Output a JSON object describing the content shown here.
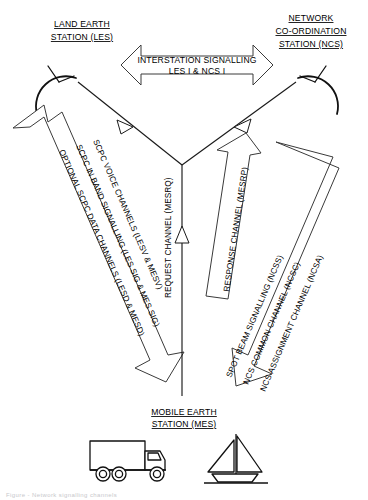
{
  "diagram": {
    "title_bottom_fragment": "Figure  - Network signalling channels",
    "nodes": {
      "les": {
        "line1": "LAND EARTH",
        "line2": "STATION (LES)",
        "icon": "satellite-dish-icon"
      },
      "ncs": {
        "line1": "NETWORK",
        "line2": "CO-ORDINATION",
        "line3": "STATION (NCS)",
        "icon": "satellite-dish-icon"
      },
      "mes": {
        "line1": "MOBILE EARTH",
        "line2": "STATION (MES)",
        "icon_truck": "truck-icon",
        "icon_boat": "sailboat-icon"
      }
    },
    "links": {
      "interstation": {
        "line1": "INTERSTATION SIGNALLING",
        "line2": "LES I & NCS I",
        "style": "double-headed-block-arrow",
        "direction": "bidirectional"
      },
      "les_mes": {
        "line1": "SCPC VOICE CHANNELS (LESV & MESV)",
        "line2": "SCPC IN BAND SIGNALLING (LES SIG & MES SIG)",
        "line3": "OPTIONAL SCPC DATA CHANNELS (LESD & MESD)",
        "style": "double-headed-block-arrow",
        "direction": "bidirectional"
      },
      "request": {
        "line1": "REQUEST CHANNEL (MESRQ)",
        "style": "thin-line-arrow",
        "direction": "mes-to-satellite"
      },
      "response": {
        "line1": "RESPONSE CHANNEL (MESRP)",
        "style": "block-arrow",
        "direction": "upward"
      },
      "ncs_mes": {
        "line1": "SPOT BEAM SIGNALLING (NCSS)",
        "line2": "NCS COMMON CHANNEL (NCSC)",
        "line3": "NCS ASSIGNMENT CHANNEL (NCSA)",
        "style": "block-arrow",
        "direction": "ncs-to-mes"
      }
    },
    "colors": {
      "ink": "#000000",
      "outline": "#3a3a3a",
      "background": "#ffffff"
    }
  }
}
